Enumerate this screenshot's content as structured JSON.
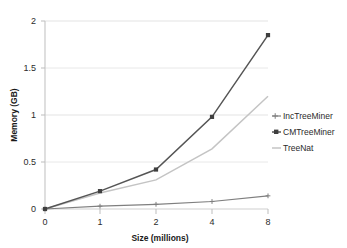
{
  "chart_data": {
    "type": "line",
    "title": "",
    "xlabel": "Size (millions)",
    "ylabel": "Memory (GB)",
    "categories": [
      "0",
      "1",
      "2",
      "4",
      "8"
    ],
    "x": [
      0,
      1,
      2,
      4,
      8
    ],
    "ylim": [
      0,
      2
    ],
    "yticks": [
      0,
      0.5,
      1,
      1.5,
      2
    ],
    "ytick_labels": [
      "0",
      "0.5",
      "1",
      "1.5",
      "2"
    ],
    "xtick_labels": [
      "0",
      "1",
      "2",
      "4",
      "8"
    ],
    "grid": "horizontal",
    "legend_position": "right",
    "series": [
      {
        "name": "IncTreeMiner",
        "values": [
          0,
          0.03,
          0.05,
          0.08,
          0.14
        ],
        "color": "#7f7f7f",
        "marker": "plus"
      },
      {
        "name": "CMTreeMiner",
        "values": [
          0,
          0.19,
          0.42,
          0.98,
          1.85
        ],
        "color": "#555555",
        "marker": "square"
      },
      {
        "name": "TreeNat",
        "values": [
          0,
          0.17,
          0.31,
          0.64,
          1.2
        ],
        "color": "#c4c4c4",
        "marker": "none"
      }
    ]
  },
  "axes": {
    "y_title": "Memory (GB)",
    "x_title": "Size (millions)",
    "y_labels": [
      "2",
      "1.5",
      "1",
      "0.5",
      "0"
    ],
    "x_labels": [
      "0",
      "1",
      "2",
      "4",
      "8"
    ]
  },
  "legend": {
    "items": [
      {
        "label": "IncTreeMiner"
      },
      {
        "label": "CMTreeMiner"
      },
      {
        "label": "TreeNat"
      }
    ]
  },
  "colors": {
    "grid": "#e3e3e3",
    "axis": "#c9c9c9",
    "background": "#ffffff",
    "inc": "#7f7f7f",
    "cm": "#555555",
    "treenat": "#c4c4c4"
  }
}
